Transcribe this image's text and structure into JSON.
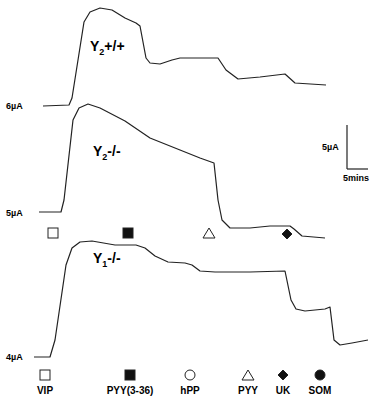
{
  "chart_data": {
    "type": "line",
    "title": "",
    "xlabel": "Time",
    "ylabel": "Current (µA)",
    "grid": false,
    "scale_bar": {
      "vertical": "5µA",
      "horizontal": "5mins"
    },
    "series": [
      {
        "name": "Y2+/+",
        "label_main": "Y",
        "label_sub": "2",
        "label_suffix": "+/+",
        "baseline_label": "6µA",
        "points": [
          [
            43,
            106
          ],
          [
            69,
            105
          ],
          [
            72,
            98
          ],
          [
            84,
            22
          ],
          [
            90,
            12
          ],
          [
            100,
            8
          ],
          [
            112,
            10
          ],
          [
            125,
            18
          ],
          [
            136,
            23
          ],
          [
            140,
            26
          ],
          [
            146,
            58
          ],
          [
            150,
            63
          ],
          [
            160,
            64
          ],
          [
            172,
            60
          ],
          [
            180,
            58
          ],
          [
            196,
            58
          ],
          [
            218,
            58
          ],
          [
            226,
            70
          ],
          [
            238,
            79
          ],
          [
            260,
            77
          ],
          [
            285,
            74
          ],
          [
            295,
            83
          ],
          [
            326,
            85
          ]
        ]
      },
      {
        "name": "Y2-/-",
        "label_main": "Y",
        "label_sub": "2",
        "label_suffix": "-/-",
        "baseline_label": "5µA",
        "points": [
          [
            39,
            212
          ],
          [
            61,
            212
          ],
          [
            64,
            200
          ],
          [
            73,
            120
          ],
          [
            79,
            108
          ],
          [
            88,
            104
          ],
          [
            100,
            108
          ],
          [
            125,
            121
          ],
          [
            150,
            138
          ],
          [
            180,
            150
          ],
          [
            200,
            158
          ],
          [
            214,
            163
          ],
          [
            218,
            200
          ],
          [
            222,
            220
          ],
          [
            230,
            228
          ],
          [
            250,
            228
          ],
          [
            270,
            226
          ],
          [
            290,
            226
          ],
          [
            294,
            229
          ],
          [
            302,
            236
          ],
          [
            325,
            238
          ]
        ]
      },
      {
        "name": "Y1-/-",
        "label_main": "Y",
        "label_sub": "1",
        "label_suffix": "-/-",
        "baseline_label": "4µA",
        "points": [
          [
            34,
            357
          ],
          [
            50,
            357
          ],
          [
            55,
            340
          ],
          [
            66,
            265
          ],
          [
            72,
            248
          ],
          [
            80,
            242
          ],
          [
            92,
            241
          ],
          [
            115,
            245
          ],
          [
            136,
            245
          ],
          [
            145,
            248
          ],
          [
            155,
            256
          ],
          [
            168,
            262
          ],
          [
            185,
            263
          ],
          [
            192,
            265
          ],
          [
            200,
            271
          ],
          [
            215,
            272
          ],
          [
            250,
            272
          ],
          [
            285,
            271
          ],
          [
            291,
            300
          ],
          [
            296,
            309
          ],
          [
            305,
            311
          ],
          [
            325,
            309
          ],
          [
            330,
            307
          ],
          [
            334,
            340
          ],
          [
            340,
            345
          ],
          [
            352,
            343
          ],
          [
            368,
            340
          ]
        ]
      }
    ],
    "markers_mid": [
      {
        "symbol": "open-square",
        "x": 53,
        "y": 233
      },
      {
        "symbol": "filled-square",
        "x": 128,
        "y": 233
      },
      {
        "symbol": "open-triangle",
        "x": 209,
        "y": 233
      },
      {
        "symbol": "filled-diamond",
        "x": 287,
        "y": 234
      }
    ],
    "legend": [
      {
        "symbol": "open-square",
        "label": "VIP",
        "x": 45
      },
      {
        "symbol": "filled-square",
        "label": "PYY(3-36)",
        "x": 130
      },
      {
        "symbol": "open-circle",
        "label": "hPP",
        "x": 190
      },
      {
        "symbol": "open-triangle",
        "label": "PYY",
        "x": 248
      },
      {
        "symbol": "filled-diamond",
        "label": "UK",
        "x": 283
      },
      {
        "symbol": "filled-circle",
        "label": "SOM",
        "x": 320
      }
    ]
  },
  "labels": {
    "baseline_6": "6µA",
    "baseline_5": "5µA",
    "baseline_4": "4µA",
    "scale_current": "5µA",
    "scale_time": "5mins",
    "t1_main": "Y",
    "t1_sub": "2",
    "t1_suffix": "+/+",
    "t2_main": "Y",
    "t2_sub": "2",
    "t2_suffix": "-/-",
    "t3_main": "Y",
    "t3_sub": "1",
    "t3_suffix": "-/-",
    "legend_vip": "VIP",
    "legend_pyy336": "PYY(3-36)",
    "legend_hpp": "hPP",
    "legend_pyy": "PYY",
    "legend_uk": "UK",
    "legend_som": "SOM"
  }
}
